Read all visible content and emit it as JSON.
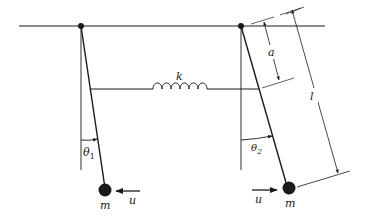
{
  "diagram": {
    "type": "coupled pendulums with spring",
    "colors": {
      "ink": "#1a1a1a",
      "background": "#ffffff"
    },
    "labels": {
      "spring": "k",
      "attach_distance": "a",
      "rod_length": "l",
      "angle_left": "θ",
      "angle_left_sub": "1",
      "angle_right": "θ",
      "angle_right_sub": "2",
      "mass_left": "m",
      "mass_right": "m",
      "force_left": "u",
      "force_right": "u"
    }
  }
}
